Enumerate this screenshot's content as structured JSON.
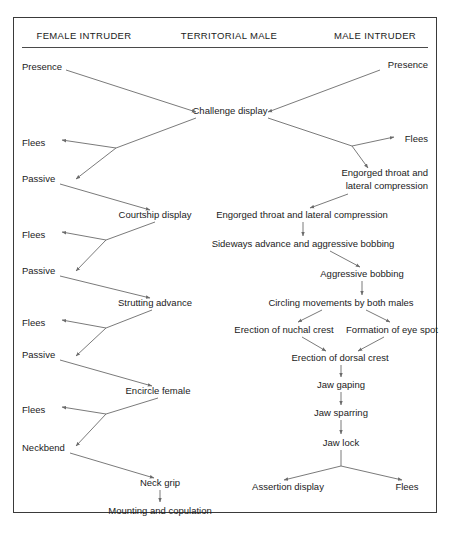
{
  "diagram": {
    "background_color": "#ffffff",
    "line_color": "#6b6b6b",
    "text_color": "#1b1b1b",
    "border_color": "#3a3a3a",
    "columns": [
      {
        "id": "female-intruder",
        "label": "FEMALE INTRUDER",
        "cx": 84,
        "cy": 35
      },
      {
        "id": "territorial-male",
        "label": "TERRITORIAL MALE",
        "cx": 229,
        "cy": 35
      },
      {
        "id": "male-intruder",
        "label": "MALE INTRUDER",
        "cx": 375,
        "cy": 35
      }
    ],
    "nodes": [
      {
        "id": "presence-female",
        "label": "Presence",
        "x": 22,
        "y": 66,
        "align": "lft"
      },
      {
        "id": "presence-male",
        "label": "Presence",
        "x": 428,
        "y": 64,
        "align": "rgt"
      },
      {
        "id": "challenge-display",
        "label": "Challenge display",
        "x": 230,
        "y": 110,
        "align": "ctr"
      },
      {
        "id": "flees-f1",
        "label": "Flees",
        "x": 22,
        "y": 142,
        "align": "lft"
      },
      {
        "id": "passive-f1",
        "label": "Passive",
        "x": 22,
        "y": 178,
        "align": "lft"
      },
      {
        "id": "courtship-display",
        "label": "Courtship display",
        "x": 155,
        "y": 214,
        "align": "ctr"
      },
      {
        "id": "flees-f2",
        "label": "Flees",
        "x": 22,
        "y": 234,
        "align": "lft"
      },
      {
        "id": "passive-f2",
        "label": "Passive",
        "x": 22,
        "y": 270,
        "align": "lft"
      },
      {
        "id": "strutting-advance",
        "label": "Strutting advance",
        "x": 155,
        "y": 302,
        "align": "ctr"
      },
      {
        "id": "flees-f3",
        "label": "Flees",
        "x": 22,
        "y": 322,
        "align": "lft"
      },
      {
        "id": "passive-f3",
        "label": "Passive",
        "x": 22,
        "y": 354,
        "align": "lft"
      },
      {
        "id": "encircle-female",
        "label": "Encircle female",
        "x": 158,
        "y": 390,
        "align": "ctr"
      },
      {
        "id": "flees-f4",
        "label": "Flees",
        "x": 22,
        "y": 409,
        "align": "lft"
      },
      {
        "id": "neckbend",
        "label": "Neckbend",
        "x": 22,
        "y": 447,
        "align": "lft"
      },
      {
        "id": "neck-grip",
        "label": "Neck grip",
        "x": 160,
        "y": 482,
        "align": "ctr"
      },
      {
        "id": "mounting-and-copulation",
        "label": "Mounting and copulation",
        "x": 160,
        "y": 510,
        "align": "ctr"
      },
      {
        "id": "flees-m1",
        "label": "Flees",
        "x": 428,
        "y": 138,
        "align": "rgt"
      },
      {
        "id": "engorged-throat-lateral-compression-male-intruder",
        "label": "Engorged throat and\nlateral compression",
        "x": 428,
        "y": 179,
        "align": "rgt"
      },
      {
        "id": "engorged-throat-lateral-compression-territorial",
        "label": "Engorged throat and lateral compression",
        "x": 302,
        "y": 214,
        "align": "ctr"
      },
      {
        "id": "sideways-advance-aggressive-bobbing",
        "label": "Sideways advance and aggressive bobbing",
        "x": 303,
        "y": 243,
        "align": "ctr"
      },
      {
        "id": "aggressive-bobbing",
        "label": "Aggressive bobbing",
        "x": 362,
        "y": 273,
        "align": "ctr"
      },
      {
        "id": "circling-movements",
        "label": "Circling movements by both males",
        "x": 341,
        "y": 302,
        "align": "ctr"
      },
      {
        "id": "erection-of-nuchal-crest",
        "label": "Erection of nuchal crest",
        "x": 284,
        "y": 329,
        "align": "ctr"
      },
      {
        "id": "formation-of-eye-spot",
        "label": "Formation of eye spot",
        "x": 392,
        "y": 329,
        "align": "ctr"
      },
      {
        "id": "erection-of-dorsal-crest",
        "label": "Erection of dorsal crest",
        "x": 340,
        "y": 357,
        "align": "ctr"
      },
      {
        "id": "jaw-gaping",
        "label": "Jaw gaping",
        "x": 341,
        "y": 384,
        "align": "ctr"
      },
      {
        "id": "jaw-sparring",
        "label": "Jaw sparring",
        "x": 341,
        "y": 412,
        "align": "ctr"
      },
      {
        "id": "jaw-lock",
        "label": "Jaw lock",
        "x": 341,
        "y": 442,
        "align": "ctr"
      },
      {
        "id": "assertion-display",
        "label": "Assertion display",
        "x": 288,
        "y": 486,
        "align": "ctr"
      },
      {
        "id": "flees-m2",
        "label": "Flees",
        "x": 407,
        "y": 486,
        "align": "ctr"
      }
    ],
    "edges": [
      {
        "from": "presence-female",
        "to": "challenge-display",
        "path": "M 66 70 L 196 112"
      },
      {
        "from": "presence-male",
        "to": "challenge-display",
        "path": "M 380 70 L 268 112"
      },
      {
        "from": "challenge-display",
        "to": "branch-f1",
        "path": "M 196 118 L 116 148"
      },
      {
        "from": "branch-f1",
        "to": "flees-f1",
        "path": "M 116 148 L 62 140"
      },
      {
        "from": "branch-f1",
        "to": "passive-f1",
        "path": "M 116 148 L 76 179"
      },
      {
        "from": "passive-f1",
        "to": "courtship-display",
        "path": "M 60 184 L 150 210"
      },
      {
        "from": "courtship-display",
        "to": "branch-f2",
        "path": "M 155 222 L 106 240"
      },
      {
        "from": "branch-f2",
        "to": "flees-f2",
        "path": "M 106 240 L 62 232"
      },
      {
        "from": "branch-f2",
        "to": "passive-f2",
        "path": "M 106 240 L 76 271"
      },
      {
        "from": "passive-f2",
        "to": "strutting-advance",
        "path": "M 60 276 L 150 298"
      },
      {
        "from": "strutting-advance",
        "to": "branch-f3",
        "path": "M 152 310 L 106 328"
      },
      {
        "from": "branch-f3",
        "to": "flees-f3",
        "path": "M 106 328 L 62 320"
      },
      {
        "from": "branch-f3",
        "to": "passive-f3",
        "path": "M 106 328 L 76 356"
      },
      {
        "from": "passive-f3",
        "to": "encircle-female",
        "path": "M 60 360 L 152 386"
      },
      {
        "from": "encircle-female",
        "to": "branch-f4",
        "path": "M 158 398 L 106 414"
      },
      {
        "from": "branch-f4",
        "to": "flees-f4",
        "path": "M 106 414 L 62 407"
      },
      {
        "from": "branch-f4",
        "to": "neckbend",
        "path": "M 106 414 L 76 446"
      },
      {
        "from": "neckbend",
        "to": "neck-grip",
        "path": "M 70 453 L 154 478"
      },
      {
        "from": "neck-grip",
        "to": "mounting-and-copulation",
        "path": "M 160 490 L 160 502"
      },
      {
        "from": "challenge-display",
        "to": "branch-m1",
        "path": "M 268 118 L 352 146"
      },
      {
        "from": "branch-m1",
        "to": "flees-m1",
        "path": "M 352 146 L 394 137"
      },
      {
        "from": "branch-m1",
        "to": "engorged-male-intruder",
        "path": "M 352 146 L 368 168"
      },
      {
        "from": "engorged-throat-lateral-compression-male-intruder",
        "to": "engorged-throat-lateral-compression-territorial",
        "path": "M 348 194 L 310 208"
      },
      {
        "from": "engorged-throat-lateral-compression-territorial",
        "to": "sideways-advance-aggressive-bobbing",
        "path": "M 303 222 L 303 236"
      },
      {
        "from": "sideways-advance-aggressive-bobbing",
        "to": "aggressive-bobbing",
        "path": "M 330 251 L 360 267"
      },
      {
        "from": "aggressive-bobbing",
        "to": "circling-movements",
        "path": "M 362 281 L 362 295"
      },
      {
        "from": "circling-movements",
        "to": "erection-of-nuchal-crest",
        "path": "M 322 310 L 298 322"
      },
      {
        "from": "circling-movements",
        "to": "formation-of-eye-spot",
        "path": "M 366 310 L 390 322"
      },
      {
        "from": "erection-of-nuchal-crest",
        "to": "erection-of-dorsal-crest",
        "path": "M 302 337 L 326 351"
      },
      {
        "from": "formation-of-eye-spot",
        "to": "erection-of-dorsal-crest",
        "path": "M 384 337 L 358 351"
      },
      {
        "from": "erection-of-dorsal-crest",
        "to": "jaw-gaping",
        "path": "M 341 365 L 341 377"
      },
      {
        "from": "jaw-gaping",
        "to": "jaw-sparring",
        "path": "M 341 392 L 341 405"
      },
      {
        "from": "jaw-sparring",
        "to": "jaw-lock",
        "path": "M 341 420 L 341 434"
      },
      {
        "from": "jaw-lock",
        "to": "fork-m2",
        "path": "M 341 450 L 341 466"
      },
      {
        "from": "fork-m2",
        "to": "assertion-display",
        "path": "M 341 466 L 284 480"
      },
      {
        "from": "fork-m2",
        "to": "flees-m2",
        "path": "M 341 466 L 402 480"
      }
    ]
  }
}
